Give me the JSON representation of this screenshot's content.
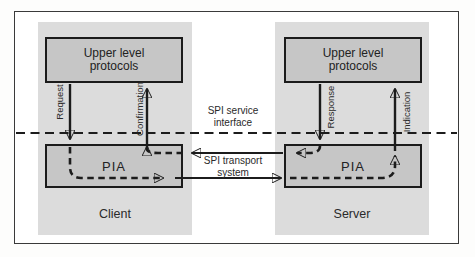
{
  "diagram": {
    "client": {
      "region_label": "Client",
      "upper_box_line1": "Upper level",
      "upper_box_line2": "protocols",
      "pia_label": "PIA",
      "request_label": "Request",
      "confirmation_label": "Confirmation"
    },
    "server": {
      "region_label": "Server",
      "upper_box_line1": "Upper level",
      "upper_box_line2": "protocols",
      "pia_label": "PIA",
      "response_label": "Response",
      "indication_label": "Indication"
    },
    "interface_label_line1": "SPI service",
    "interface_label_line2": "interface",
    "transport_label_line1": "SPI transport",
    "transport_label_line2": "system",
    "colors": {
      "region_panel": "#dcdcdc",
      "box_fill": "#c6c6c6",
      "line": "#1c1c1c",
      "background": "#ffffff"
    }
  }
}
